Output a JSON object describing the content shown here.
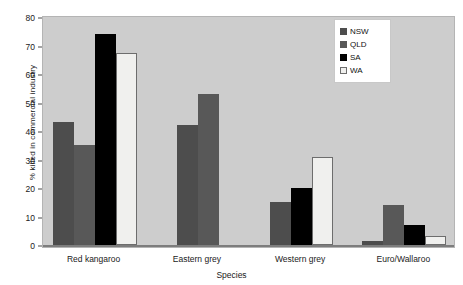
{
  "chart_data": {
    "type": "bar",
    "title": "",
    "xlabel": "Species",
    "ylabel": "% killed in commercial industry",
    "categories": [
      "Red kangaroo",
      "Eastern grey",
      "Western grey",
      "Euro/Wallaroo"
    ],
    "series": [
      {
        "name": "NSW",
        "color": "#4d4d4d",
        "values": [
          43,
          42,
          15,
          1.5
        ]
      },
      {
        "name": "QLD",
        "color": "#585858",
        "values": [
          35,
          53,
          null,
          14
        ]
      },
      {
        "name": "SA",
        "color": "#000000",
        "values": [
          74,
          null,
          20,
          7
        ]
      },
      {
        "name": "WA",
        "color": "#f0f0ee",
        "values": [
          67.5,
          null,
          31,
          3
        ]
      }
    ],
    "ylim": [
      0,
      80
    ],
    "yticks": [
      0,
      10,
      20,
      30,
      40,
      50,
      60,
      70,
      80
    ],
    "ytick_labels": [
      "0",
      "10",
      "20",
      "30",
      "40",
      "50",
      "60",
      "70",
      "80"
    ],
    "grid": false,
    "legend_position": "top-right",
    "plot_background": "#cdcdcd",
    "figure_background": "#ffffff"
  },
  "legend": {
    "entries": [
      {
        "label": "NSW",
        "swatch": "nsw"
      },
      {
        "label": "QLD",
        "swatch": "qld"
      },
      {
        "label": "SA",
        "swatch": "sa"
      },
      {
        "label": "WA",
        "swatch": "wa"
      }
    ]
  }
}
